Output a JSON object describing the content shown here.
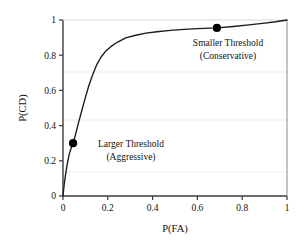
{
  "chart_data": {
    "type": "line",
    "title": "",
    "subtitle": "",
    "xlabel": "P(FA)",
    "ylabel": "P(CD)",
    "xlim": [
      0,
      1
    ],
    "ylim": [
      0,
      1
    ],
    "xticks": [
      "0",
      "0.2",
      "0.4",
      "0.6",
      "0.8",
      "1"
    ],
    "xtick_values": [
      0,
      0.2,
      0.4,
      0.6,
      0.8,
      1
    ],
    "yticks": [
      "0",
      "0.2",
      "0.4",
      "0.6",
      "0.8",
      "1"
    ],
    "ytick_values": [
      0,
      0.2,
      0.4,
      0.6,
      0.8,
      1
    ],
    "grid": "horizontal-faint",
    "legend": "none",
    "legend_position": "",
    "line_color": "#1a1a1a",
    "marker_color": "#000000",
    "axis_color": "#3a3a3a",
    "grid_color": "#e8e8e8",
    "background": "#ffffff",
    "series": [
      {
        "name": "ROC curve",
        "x": [
          0.0,
          0.004,
          0.01,
          0.018,
          0.028,
          0.04,
          0.045,
          0.055,
          0.07,
          0.085,
          0.1,
          0.115,
          0.13,
          0.15,
          0.17,
          0.19,
          0.215,
          0.24,
          0.28,
          0.32,
          0.37,
          0.42,
          0.48,
          0.54,
          0.6,
          0.687,
          0.76,
          0.83,
          0.9,
          0.95,
          1.0
        ],
        "y": [
          0.0,
          0.05,
          0.11,
          0.175,
          0.24,
          0.285,
          0.3,
          0.345,
          0.42,
          0.49,
          0.56,
          0.625,
          0.68,
          0.745,
          0.79,
          0.822,
          0.85,
          0.872,
          0.898,
          0.912,
          0.925,
          0.933,
          0.941,
          0.947,
          0.951,
          0.955,
          0.963,
          0.972,
          0.982,
          0.99,
          1.0
        ]
      }
    ],
    "markers": [
      {
        "name": "larger-threshold",
        "x": 0.045,
        "y": 0.3,
        "label_line1": "Larger Threshold",
        "label_line2": "(Aggressive)"
      },
      {
        "name": "smaller-threshold",
        "x": 0.687,
        "y": 0.955,
        "label_line1": "Smaller Threshold",
        "label_line2": "(Conservative)"
      }
    ]
  }
}
